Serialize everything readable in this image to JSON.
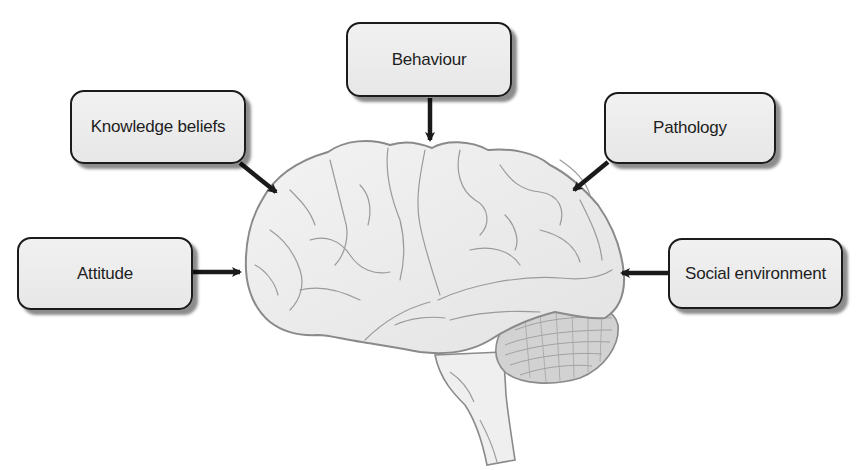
{
  "diagram": {
    "center": {
      "label": "brain",
      "description": "Lateral view of the human brain"
    },
    "nodes": [
      {
        "id": "behaviour",
        "label": "Behaviour",
        "position": "top"
      },
      {
        "id": "knowledge",
        "label": "Knowledge beliefs",
        "position": "top-left"
      },
      {
        "id": "pathology",
        "label": "Pathology",
        "position": "top-right"
      },
      {
        "id": "attitude",
        "label": "Attitude",
        "position": "left"
      },
      {
        "id": "social",
        "label": "Social environment",
        "position": "right"
      }
    ],
    "edges": [
      {
        "from": "behaviour",
        "to": "brain"
      },
      {
        "from": "knowledge",
        "to": "brain"
      },
      {
        "from": "pathology",
        "to": "brain"
      },
      {
        "from": "attitude",
        "to": "brain"
      },
      {
        "from": "social",
        "to": "brain"
      }
    ],
    "colors": {
      "box_fill": "#ececec",
      "box_border": "#1b1b1b",
      "arrow": "#1a1a1a",
      "brain_fill": "#ededed",
      "brain_outline": "#8a8a8a",
      "cerebellum_fill": "#d2d2d2"
    }
  }
}
